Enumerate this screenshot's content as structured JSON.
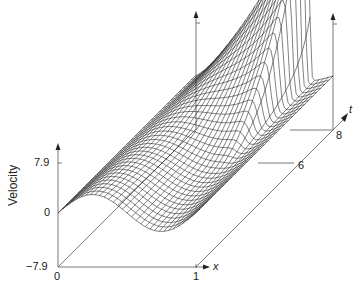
{
  "chart_data": {
    "type": "surface-wireframe",
    "title": "",
    "xlabel": "x",
    "ylabel": "Velocity",
    "tlabel": "t",
    "x_ticks": [
      "0",
      "1"
    ],
    "x_range": [
      0,
      1
    ],
    "y_ticks": [
      "-7.9",
      "0",
      "7.9"
    ],
    "y_range": [
      -7.9,
      7.9
    ],
    "t_ticks": [
      "6",
      "8"
    ],
    "t_range_max": 8,
    "mesh": {
      "x_lines": 30,
      "t_lines": 34
    },
    "grid": false,
    "line_color": "#1a1a1a",
    "axis_color": "#555555"
  },
  "labels": {
    "y_top": "7.9",
    "y_zero": "0",
    "y_bottom": "−7.9",
    "x_zero": "0",
    "x_one": "1",
    "x_axis": "x",
    "t_axis": "t",
    "t_six": "6",
    "t_eight": "8",
    "y_axis": "Velocity"
  }
}
